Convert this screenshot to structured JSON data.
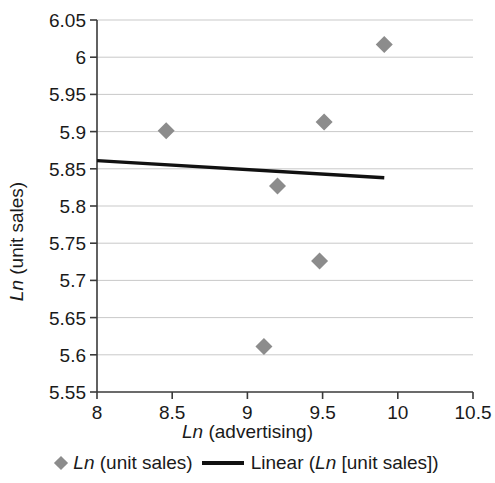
{
  "chart_data": {
    "type": "scatter",
    "title": "",
    "xlabel": "Ln (advertising)",
    "ylabel": "Ln (unit sales)",
    "xlim": [
      8,
      10.5
    ],
    "ylim": [
      5.55,
      6.05
    ],
    "xticks": [
      "8",
      "8.5",
      "9",
      "9.5",
      "10",
      "10.5"
    ],
    "xtick_values": [
      8,
      8.5,
      9,
      9.5,
      10,
      10.5
    ],
    "yticks": [
      "5.55",
      "5.6",
      "5.65",
      "5.7",
      "5.75",
      "5.8",
      "5.85",
      "5.9",
      "5.95",
      "6",
      "6.05"
    ],
    "ytick_values": [
      5.55,
      5.6,
      5.65,
      5.7,
      5.75,
      5.8,
      5.85,
      5.9,
      5.95,
      6.0,
      6.05
    ],
    "grid": "horizontal",
    "legend_position": "bottom",
    "series": [
      {
        "name": "Ln (unit sales)",
        "type": "scatter",
        "marker": "diamond",
        "color": "#8c8c8c",
        "points": [
          {
            "x": 8.46,
            "y": 5.901
          },
          {
            "x": 9.11,
            "y": 5.611
          },
          {
            "x": 9.2,
            "y": 5.827
          },
          {
            "x": 9.48,
            "y": 5.726
          },
          {
            "x": 9.51,
            "y": 5.913
          },
          {
            "x": 9.91,
            "y": 6.017
          }
        ]
      },
      {
        "name": "Linear (Ln [unit sales])",
        "type": "line",
        "color": "#111111",
        "points": [
          {
            "x": 8.0,
            "y": 5.861
          },
          {
            "x": 9.91,
            "y": 5.838
          }
        ]
      }
    ]
  },
  "axis_titles": {
    "x_italic": "Ln",
    "x_rest": " (advertising)",
    "y_italic": "Ln",
    "y_rest": " (unit sales)"
  },
  "legend": {
    "items": [
      {
        "marker": "diamond",
        "italic": "Ln",
        "rest": " (unit sales)"
      },
      {
        "marker": "line",
        "italic": "Ln",
        "rest": "Linear (",
        "rest2": " [unit sales])"
      }
    ],
    "series1_italic": "Ln",
    "series1_rest": " (unit sales)",
    "series2_pre": "Linear (",
    "series2_italic": "Ln",
    "series2_post": " [unit sales])"
  },
  "colors": {
    "marker": "#8c8c8c",
    "trendline": "#111111",
    "grid": "#c9c9c9",
    "axis": "#3a3a3a",
    "text": "#1a1a1a"
  }
}
